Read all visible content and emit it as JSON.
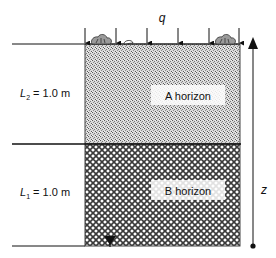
{
  "figure": {
    "flux_label": "q",
    "depth_label": "z",
    "layers": [
      {
        "id": "A",
        "name": "A horizon",
        "thickness_label_var": "L",
        "thickness_label_sub": "2",
        "thickness_label_value": " = 1.0 m",
        "pattern": "stipple"
      },
      {
        "id": "B",
        "name": "B horizon",
        "thickness_label_var": "L",
        "thickness_label_sub": "1",
        "thickness_label_value": " = 1.0 m",
        "pattern": "crosshatch"
      }
    ],
    "flux_arrow_count": 6,
    "water_table_marker": "inverted-triangle",
    "colors": {
      "line": "#111111",
      "background": "#ffffff",
      "stipple_dark": "#6e6e6e",
      "hatch_dark": "#3a3a3a"
    }
  }
}
